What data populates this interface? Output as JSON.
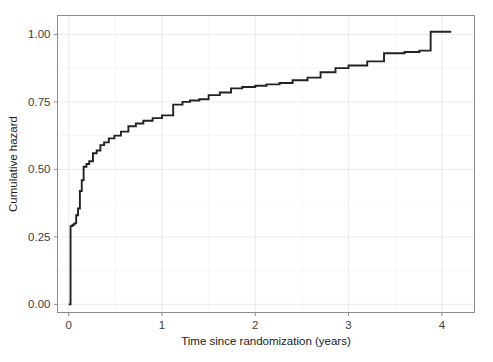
{
  "chart_data": {
    "type": "line",
    "subtype": "step-function-cumulative-hazard",
    "title": "",
    "subtitle": "",
    "xlabel": "Time since randomization (years)",
    "ylabel": "Cumulative hazard",
    "xlim": [
      -0.12,
      4.35
    ],
    "ylim": [
      -0.03,
      1.07
    ],
    "xticks": [
      0,
      1,
      2,
      3,
      4
    ],
    "xticklabels": [
      "0",
      "1",
      "2",
      "3",
      "4"
    ],
    "yticks": [
      0.0,
      0.25,
      0.5,
      0.75,
      1.0
    ],
    "yticklabels": [
      "0.00",
      "0.25",
      "0.50",
      "0.75",
      "1.00"
    ],
    "grid": true,
    "grid_color": "#ebebeb",
    "legend": false,
    "legend_position": "none",
    "line_color": "#222222",
    "background_color": "#ffffff",
    "panel_border_color": "#8c8c8c",
    "series": [
      {
        "name": "Cumulative hazard",
        "step_type": "hv",
        "x": [
          0.0,
          0.02,
          0.04,
          0.06,
          0.08,
          0.1,
          0.12,
          0.14,
          0.16,
          0.19,
          0.22,
          0.26,
          0.3,
          0.34,
          0.38,
          0.43,
          0.49,
          0.56,
          0.64,
          0.72,
          0.8,
          0.9,
          1.0,
          1.12,
          1.22,
          1.3,
          1.4,
          1.5,
          1.62,
          1.74,
          1.86,
          2.0,
          2.12,
          2.26,
          2.4,
          2.56,
          2.7,
          2.86,
          3.0,
          3.2,
          3.38,
          3.6,
          3.76,
          3.88,
          4.1
        ],
        "y": [
          0.0,
          0.29,
          0.295,
          0.3,
          0.33,
          0.355,
          0.42,
          0.46,
          0.51,
          0.52,
          0.53,
          0.56,
          0.57,
          0.59,
          0.6,
          0.615,
          0.625,
          0.64,
          0.66,
          0.67,
          0.68,
          0.69,
          0.7,
          0.74,
          0.75,
          0.755,
          0.76,
          0.775,
          0.785,
          0.8,
          0.805,
          0.81,
          0.815,
          0.82,
          0.83,
          0.84,
          0.86,
          0.875,
          0.885,
          0.9,
          0.93,
          0.935,
          0.94,
          1.01,
          1.01
        ]
      }
    ]
  },
  "axes": {
    "x_title": "Time since randomization (years)",
    "y_title": "Cumulative hazard"
  }
}
